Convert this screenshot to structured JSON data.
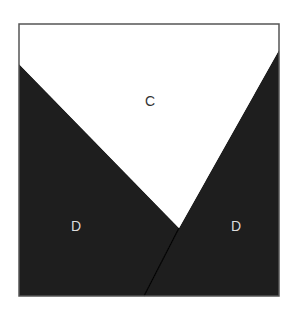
{
  "diagram": {
    "regions": [
      {
        "id": "top",
        "label": "C",
        "fill": "#ffffff",
        "text_color": "#333333"
      },
      {
        "id": "left",
        "label": "D",
        "fill": "#1e1e1e",
        "text_color": "#dddddd"
      },
      {
        "id": "right",
        "label": "D",
        "fill": "#1e1e1e",
        "text_color": "#dddddd"
      }
    ],
    "border_color": "#555555",
    "divider_color": "#000000"
  }
}
